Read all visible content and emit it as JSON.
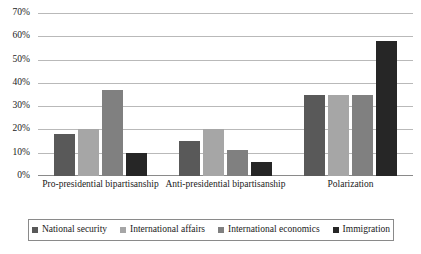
{
  "chart_data": {
    "type": "bar",
    "title": "",
    "xlabel": "",
    "ylabel": "",
    "ylim": [
      0,
      70
    ],
    "ytick_labels": [
      "0%",
      "10%",
      "20%",
      "30%",
      "40%",
      "50%",
      "60%",
      "70%"
    ],
    "ytick_values": [
      0,
      10,
      20,
      30,
      40,
      50,
      60,
      70
    ],
    "grid": true,
    "legend_position": "bottom",
    "categories": [
      "Pro-presidential bipartisanship",
      "Anti-presidential bipartisanship",
      "Polarization"
    ],
    "series": [
      {
        "name": "National security",
        "color": "#595959",
        "values": [
          18,
          15,
          35
        ]
      },
      {
        "name": "International affairs",
        "color": "#a6a6a6",
        "values": [
          20,
          20,
          35
        ]
      },
      {
        "name": "International economics",
        "color": "#808080",
        "values": [
          37,
          11,
          35
        ]
      },
      {
        "name": "Immigration",
        "color": "#262626",
        "values": [
          10,
          6,
          58
        ]
      }
    ]
  }
}
